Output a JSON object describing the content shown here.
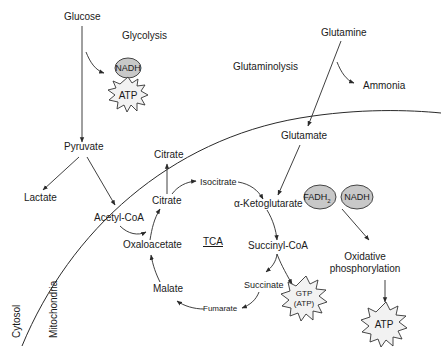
{
  "colors": {
    "line": "#2a2a2a",
    "cofactor_fill": "#c8c8c8",
    "energy_fill": "#f2f2f2",
    "background": "#ffffff"
  },
  "compartments": {
    "cytosol": "Cytosol",
    "mitochondria": "Mitochondria"
  },
  "pathways": {
    "glycolysis": "Glycolysis",
    "glutaminolysis": "Glutaminolysis",
    "tca": "TCA",
    "oxphos_line1": "Oxidative",
    "oxphos_line2": "phosphorylation"
  },
  "metabolites": {
    "glucose": "Glucose",
    "pyruvate": "Pyruvate",
    "lactate": "Lactate",
    "acetyl_coa": "Acetyl-CoA",
    "citrate_cytosol": "Citrate",
    "citrate": "Citrate",
    "isocitrate": "Isocitrate",
    "alpha_ketoglutarate": "α-Ketoglutarate",
    "succinyl_coa": "Succinyl-CoA",
    "succinate": "Succinate",
    "fumarate": "Fumarate",
    "malate": "Malate",
    "oxaloacetate": "Oxaloacetate",
    "glutamine": "Glutamine",
    "glutamate": "Glutamate",
    "ammonia": "Ammonia"
  },
  "cofactors": {
    "nadh_glycolysis": "NADH",
    "fadh2_base": "FADH",
    "fadh2_sub": "2",
    "nadh_tca": "NADH"
  },
  "energy": {
    "atp_glycolysis": "ATP",
    "gtp_line1": "GTP",
    "gtp_line2": "(ATP)",
    "atp_oxphos": "ATP"
  }
}
